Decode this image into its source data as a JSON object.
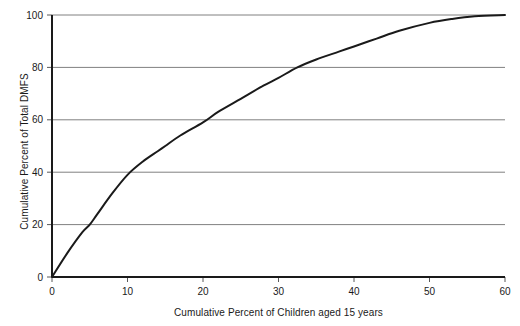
{
  "chart_data": {
    "type": "line",
    "title": "",
    "xlabel": "Cumulative Percent of Children aged 15 years",
    "ylabel": "Cumulative Percent of Total DMFS",
    "xlim": [
      0,
      60
    ],
    "ylim": [
      0,
      100
    ],
    "xticks": [
      0,
      10,
      20,
      30,
      40,
      50,
      60
    ],
    "yticks": [
      0,
      20,
      40,
      60,
      80,
      100
    ],
    "xtick_labels": [
      "0",
      "10",
      "20",
      "30",
      "40",
      "50",
      "60"
    ],
    "ytick_labels": [
      "0",
      "20",
      "40",
      "60",
      "80",
      "100"
    ],
    "grid": "horizontal",
    "grid_color": "#808080",
    "legend": "none",
    "series": [
      {
        "name": "Cumulative DMFS distribution",
        "color": "#1a1a1a",
        "line_width": 2,
        "x": [
          0,
          2,
          4,
          5,
          6,
          8,
          10,
          12,
          14,
          15,
          17,
          20,
          22,
          25,
          28,
          30,
          32.5,
          35,
          38,
          40,
          43,
          46,
          50,
          53,
          56,
          60
        ],
        "y": [
          0,
          9,
          17,
          20,
          24,
          32,
          39,
          44,
          48,
          50,
          54,
          59,
          63,
          68,
          73,
          76,
          80,
          83,
          86,
          88,
          91,
          94,
          97,
          98.5,
          99.5,
          100
        ]
      }
    ],
    "annotations": []
  },
  "axes": {
    "axis_color": "#1a1a1a",
    "tick_color": "#595959"
  }
}
